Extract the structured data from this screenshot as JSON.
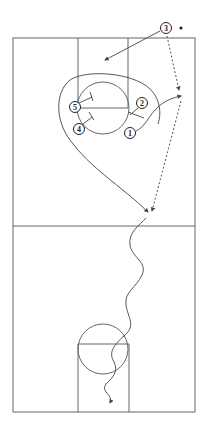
{
  "diagram": {
    "type": "basketball-play-diagram",
    "colors": {
      "line": "#555555",
      "player": "#222222",
      "background": "#ffffff"
    },
    "players": [
      {
        "id": "1",
        "label": "1",
        "x": 130,
        "y": 133
      },
      {
        "id": "2",
        "label": "2",
        "x": 142,
        "y": 103
      },
      {
        "id": "3",
        "label": "3",
        "x": 166,
        "y": 28,
        "has_ball": true
      },
      {
        "id": "4",
        "label": "4",
        "x": 79,
        "y": 129
      },
      {
        "id": "5",
        "label": "5",
        "x": 75,
        "y": 107
      }
    ],
    "ball": {
      "x": 181,
      "y": 28
    },
    "actions": [
      {
        "type": "cut",
        "from": "3",
        "description": "player 3 cuts to high post area"
      },
      {
        "type": "pass",
        "from": "3",
        "description": "dashed pass down right wing"
      },
      {
        "type": "cut",
        "from": "1",
        "description": "player 1 cuts to right wing"
      },
      {
        "type": "screen",
        "by": "2",
        "description": "2 sets screen"
      },
      {
        "type": "screen",
        "by": "5",
        "description": "5 sets screen"
      },
      {
        "type": "screen",
        "by": "4",
        "description": "4 sets screen"
      },
      {
        "type": "cut",
        "description": "long curl around lane toward midcourt"
      },
      {
        "type": "pass",
        "description": "dashed pass to midcourt"
      },
      {
        "type": "dribble",
        "description": "dribble up court to opposite basket"
      }
    ]
  }
}
